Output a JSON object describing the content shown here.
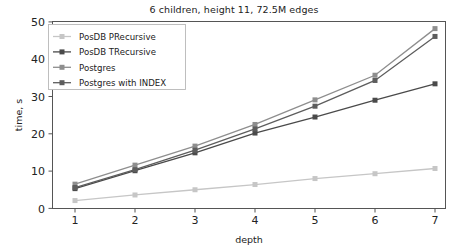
{
  "chart_data": {
    "type": "line",
    "title": "6 children, height 11, 72.5M edges",
    "xlabel": "depth",
    "ylabel": "time, s",
    "x": [
      1,
      2,
      3,
      4,
      5,
      6,
      7
    ],
    "xticks": [
      "1",
      "2",
      "3",
      "4",
      "5",
      "6",
      "7"
    ],
    "yticks": [
      "0",
      "10",
      "20",
      "30",
      "40",
      "50"
    ],
    "xlim": [
      0.7,
      7.35
    ],
    "ylim": [
      0,
      50
    ],
    "grid": false,
    "legend_position": "upper left",
    "marker": "square",
    "series": [
      {
        "name": "PosDB PRecursive",
        "color": "#c6c6c6",
        "values": [
          2.1,
          3.6,
          5.0,
          6.4,
          8.0,
          9.3,
          10.7
        ]
      },
      {
        "name": "PosDB TRecursive",
        "color": "#4a4a4a",
        "values": [
          5.3,
          10.1,
          14.9,
          20.2,
          24.5,
          29.0,
          33.4
        ]
      },
      {
        "name": "Postgres",
        "color": "#8e8e8e",
        "values": [
          6.5,
          11.6,
          16.7,
          22.5,
          29.1,
          35.7,
          48.2
        ]
      },
      {
        "name": "Postgres with INDEX",
        "color": "#5d5d5d",
        "values": [
          5.6,
          10.4,
          15.6,
          21.3,
          27.4,
          34.3,
          46.1
        ]
      }
    ]
  },
  "legend": {
    "entries": [
      "PosDB PRecursive",
      "PosDB TRecursive",
      "Postgres",
      "Postgres with INDEX"
    ]
  },
  "axes": {
    "title": "6 children, height 11, 72.5M edges",
    "xlabel": "depth",
    "ylabel": "time, s",
    "xtick_labels": [
      "1",
      "2",
      "3",
      "4",
      "5",
      "6",
      "7"
    ],
    "ytick_labels": [
      "0",
      "10",
      "20",
      "30",
      "40",
      "50"
    ]
  }
}
